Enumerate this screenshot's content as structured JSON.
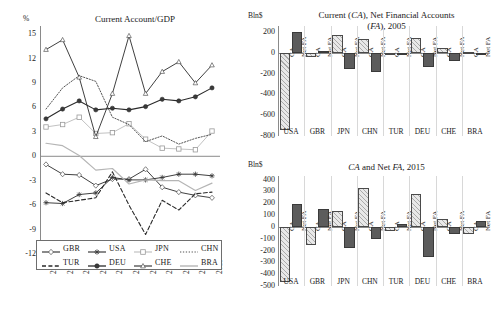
{
  "figure": {
    "panels": [
      "line-chart-current-account-gdp",
      "bar-chart-2005",
      "bar-chart-2015"
    ]
  },
  "line_panel": {
    "ylabel": "%",
    "title": "Current Account/GDP"
  },
  "bar2005_panel": {
    "ylabel": "Bln$",
    "title_line1": "Current (CA), Net Financial Accounts",
    "title_line2": "(FA), 2005",
    "title_line1_parts": [
      "Current (",
      "CA",
      "), Net Financial Accounts"
    ],
    "title_line2_parts": [
      "(",
      "FA",
      "), 2005"
    ]
  },
  "bar2015_panel": {
    "ylabel": "Bln$",
    "title": "CA and Net FA, 2015",
    "title_parts": [
      "CA",
      " and Net ",
      "FA",
      ", 2015"
    ]
  },
  "bar_series_labels": {
    "ca": "CA",
    "fa": "Net FA"
  },
  "colors": {
    "ca_fill": "#e8e8e8",
    "fa_fill": "#5c5c5c",
    "axis": "#8a8a8a",
    "text": "#1a1a1a"
  },
  "chart_data": [
    {
      "id": "current-account-gdp",
      "type": "line",
      "title": "Current Account/GDP",
      "xlabel": "",
      "ylabel": "%",
      "ylim": [
        -12,
        16
      ],
      "yticks": [
        15,
        12,
        9,
        6,
        3,
        0,
        -3,
        -6,
        -9,
        -12
      ],
      "grid": false,
      "legend_position": "bottom-inside",
      "x": [
        2005,
        2006,
        2007,
        2008,
        2009,
        2010,
        2011,
        2012,
        2013,
        2014,
        2015
      ],
      "xtick_labels": [
        "2005",
        "2006",
        "2007",
        "2008",
        "2009",
        "2010",
        "2011",
        "2012",
        "2013",
        "2014",
        "2015"
      ],
      "series": [
        {
          "name": "GBR",
          "style": "solid-thin",
          "marker": "diamond-open",
          "values": [
            -1.0,
            -2.2,
            -2.3,
            -3.6,
            -2.8,
            -2.8,
            -1.6,
            -3.8,
            -4.4,
            -4.8,
            -5.1
          ]
        },
        {
          "name": "USA",
          "style": "solid-thin",
          "marker": "star",
          "values": [
            -5.7,
            -5.8,
            -4.7,
            -4.5,
            -2.6,
            -2.9,
            -2.9,
            -2.6,
            -2.2,
            -2.2,
            -2.4
          ]
        },
        {
          "name": "JPN",
          "style": "solid-light",
          "marker": "square-open",
          "values": [
            3.6,
            3.9,
            4.8,
            2.8,
            2.9,
            4.0,
            2.1,
            1.0,
            0.9,
            0.8,
            3.1
          ]
        },
        {
          "name": "CHN",
          "style": "dotted",
          "marker": "none",
          "values": [
            5.8,
            8.4,
            9.9,
            9.2,
            4.8,
            3.9,
            1.8,
            2.5,
            1.5,
            2.2,
            2.7
          ]
        },
        {
          "name": "TUR",
          "style": "dashed",
          "marker": "none",
          "values": [
            -4.5,
            -5.7,
            -5.4,
            -5.1,
            -1.9,
            -6.0,
            -9.6,
            -5.4,
            -6.6,
            -4.6,
            -4.4
          ]
        },
        {
          "name": "DEU",
          "style": "solid-thick",
          "marker": "circle-filled",
          "values": [
            4.6,
            5.8,
            6.8,
            5.7,
            5.9,
            5.7,
            6.1,
            7.0,
            6.8,
            7.3,
            8.4
          ]
        },
        {
          "name": "CHE",
          "style": "solid-thin",
          "marker": "triangle",
          "values": [
            13.1,
            14.3,
            9.7,
            2.4,
            7.7,
            14.8,
            7.7,
            10.4,
            11.6,
            9.0,
            11.2
          ]
        },
        {
          "name": "BRA",
          "style": "solid-grey",
          "marker": "none",
          "values": [
            1.6,
            1.3,
            0.1,
            -1.7,
            -1.5,
            -3.4,
            -2.9,
            -3.0,
            -3.0,
            -4.2,
            -3.3
          ]
        }
      ]
    },
    {
      "id": "bar-2005",
      "type": "bar",
      "title": "Current (CA), Net Financial Accounts (FA), 2005",
      "ylabel": "Bln$",
      "ylim": [
        -800,
        260
      ],
      "yticks": [
        200,
        0,
        -200,
        -400,
        -600,
        -800
      ],
      "grid": false,
      "categories": [
        "USA",
        "GBR",
        "JPN",
        "CHN",
        "TUR",
        "DEU",
        "CHE",
        "BRA"
      ],
      "series": [
        {
          "name": "CA",
          "values": [
            -745,
            -35,
            170,
            134,
            -22,
            141,
            52,
            14
          ]
        },
        {
          "name": "Net FA",
          "values": [
            205,
            22,
            -153,
            -185,
            -17,
            -133,
            -80,
            -10
          ]
        }
      ]
    },
    {
      "id": "bar-2015",
      "type": "bar",
      "title": "CA and Net FA, 2015",
      "ylabel": "Bln$",
      "ylim": [
        -500,
        430
      ],
      "yticks": [
        400,
        300,
        200,
        100,
        0,
        -100,
        -200,
        -300,
        -400,
        -500
      ],
      "grid": false,
      "categories": [
        "USA",
        "GBR",
        "JPN",
        "CHN",
        "TUR",
        "DEU",
        "CHE",
        "BRA"
      ],
      "series": [
        {
          "name": "CA",
          "values": [
            -463,
            -154,
            136,
            332,
            -32,
            281,
            70,
            -59
          ]
        },
        {
          "name": "Net FA",
          "values": [
            196,
            151,
            -177,
            -106,
            24,
            -258,
            -62,
            46
          ]
        }
      ]
    }
  ]
}
